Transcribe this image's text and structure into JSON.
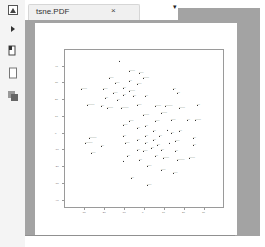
{
  "tab": {
    "title": "tsne.PDF",
    "close_glyph": "×",
    "dropdown_glyph": "▾"
  },
  "sidebar": {
    "items": [
      {
        "name": "app-logo-icon",
        "glyph": "◩"
      },
      {
        "name": "expand-arrow-icon",
        "glyph": "▸"
      },
      {
        "name": "page-view-icon",
        "glyph": "▯"
      },
      {
        "name": "single-page-icon",
        "glyph": "□"
      },
      {
        "name": "thumbnails-icon",
        "glyph": "❐"
      }
    ]
  },
  "colors": {
    "viewer_bg": "#a3a3a3",
    "page_bg": "#ffffff",
    "sidebar_bg": "#f4f4f4",
    "point": "#333333"
  },
  "chart_data": {
    "type": "scatter",
    "title": "",
    "xlabel": "",
    "ylabel": "",
    "xlim": [
      -40,
      40
    ],
    "ylim": [
      -45,
      50
    ],
    "x_ticks": [
      -30,
      -20,
      -10,
      0,
      10,
      20,
      30
    ],
    "y_ticks": [
      -40,
      -30,
      -20,
      -10,
      0,
      10,
      20,
      30,
      40
    ],
    "grid": false,
    "legend": null,
    "note": "t-SNE embedding; each point has a small text label illegible at this resolution",
    "points": [
      {
        "x": -13,
        "y": 44,
        "label": "·"
      },
      {
        "x": -8,
        "y": 38,
        "label": "~~~~"
      },
      {
        "x": -3,
        "y": 37,
        "label": "~~~"
      },
      {
        "x": -18,
        "y": 34,
        "label": "~~~"
      },
      {
        "x": -1,
        "y": 34,
        "label": "~~~~"
      },
      {
        "x": -8,
        "y": 32,
        "label": "~~"
      },
      {
        "x": -15,
        "y": 31,
        "label": "~~~"
      },
      {
        "x": -4,
        "y": 30,
        "label": "~~~"
      },
      {
        "x": -32,
        "y": 27,
        "label": "~~~~"
      },
      {
        "x": -21,
        "y": 27,
        "label": "~~~"
      },
      {
        "x": -11,
        "y": 28,
        "label": "~~"
      },
      {
        "x": -8,
        "y": 26,
        "label": "~~~~"
      },
      {
        "x": -16,
        "y": 25,
        "label": "~~~"
      },
      {
        "x": -11,
        "y": 24,
        "label": "~~"
      },
      {
        "x": -6,
        "y": 23,
        "label": "~~"
      },
      {
        "x": -20,
        "y": 22,
        "label": "~~"
      },
      {
        "x": -14,
        "y": 21,
        "label": "~~"
      },
      {
        "x": 0,
        "y": 23,
        "label": "~~"
      },
      {
        "x": 14,
        "y": 27,
        "label": "~~"
      },
      {
        "x": 16,
        "y": 25,
        "label": "~~"
      },
      {
        "x": -29,
        "y": 18,
        "label": "~~~~~"
      },
      {
        "x": -22,
        "y": 17,
        "label": "~~"
      },
      {
        "x": -19,
        "y": 16,
        "label": "~~~~"
      },
      {
        "x": -12,
        "y": 16,
        "label": "~~~~~"
      },
      {
        "x": -4,
        "y": 18,
        "label": "~~~"
      },
      {
        "x": 5,
        "y": 17,
        "label": "~~~~"
      },
      {
        "x": 10,
        "y": 17,
        "label": "~~~~~"
      },
      {
        "x": 17,
        "y": 16,
        "label": "~~~~"
      },
      {
        "x": 26,
        "y": 18,
        "label": "~~"
      },
      {
        "x": 8,
        "y": 13,
        "label": "~~~~"
      },
      {
        "x": -1,
        "y": 12,
        "label": "~~~~"
      },
      {
        "x": -8,
        "y": 8,
        "label": "~~~"
      },
      {
        "x": -11,
        "y": 6,
        "label": "~~~"
      },
      {
        "x": 5,
        "y": 8,
        "label": "~~~"
      },
      {
        "x": 13,
        "y": 9,
        "label": "~~~"
      },
      {
        "x": 21,
        "y": 9,
        "label": "~~"
      },
      {
        "x": 25,
        "y": 9,
        "label": "~~~~"
      },
      {
        "x": -4,
        "y": 4,
        "label": "~~"
      },
      {
        "x": 0,
        "y": 5,
        "label": "~~"
      },
      {
        "x": 11,
        "y": 3,
        "label": "·"
      },
      {
        "x": 4,
        "y": 2,
        "label": "~~"
      },
      {
        "x": 13,
        "y": 1,
        "label": "~~"
      },
      {
        "x": 17,
        "y": 2,
        "label": "~~"
      },
      {
        "x": -11,
        "y": -1,
        "label": "~~"
      },
      {
        "x": 0,
        "y": -1,
        "label": "~~"
      },
      {
        "x": 7,
        "y": -1,
        "label": "~~"
      },
      {
        "x": -28,
        "y": -2,
        "label": "~~~~~"
      },
      {
        "x": -4,
        "y": -3,
        "label": "~~"
      },
      {
        "x": 4,
        "y": -3,
        "label": "~~"
      },
      {
        "x": 15,
        "y": -4,
        "label": "~~~"
      },
      {
        "x": 24,
        "y": -2,
        "label": "~~"
      },
      {
        "x": -30,
        "y": -5,
        "label": "~~~~~"
      },
      {
        "x": -10,
        "y": -5,
        "label": "~~~"
      },
      {
        "x": 0,
        "y": -5,
        "label": "~~"
      },
      {
        "x": 6,
        "y": -6,
        "label": "~~"
      },
      {
        "x": 12,
        "y": -5,
        "label": "·"
      },
      {
        "x": 24,
        "y": -6,
        "label": "~~"
      },
      {
        "x": -22,
        "y": -7,
        "label": "~~"
      },
      {
        "x": -4,
        "y": -9,
        "label": "~~"
      },
      {
        "x": 3,
        "y": -8,
        "label": "~~"
      },
      {
        "x": 8,
        "y": -9,
        "label": "~~"
      },
      {
        "x": -1,
        "y": -10,
        "label": "~~~"
      },
      {
        "x": 15,
        "y": -10,
        "label": "~~"
      },
      {
        "x": -27,
        "y": -11,
        "label": "~~~"
      },
      {
        "x": -9,
        "y": -13,
        "label": "~~"
      },
      {
        "x": 5,
        "y": -13,
        "label": "~~"
      },
      {
        "x": 9,
        "y": -14,
        "label": "~~~~"
      },
      {
        "x": -3,
        "y": -15,
        "label": "~~"
      },
      {
        "x": 16,
        "y": -15,
        "label": "~~~~~"
      },
      {
        "x": 22,
        "y": -14,
        "label": "~~~~"
      },
      {
        "x": -11,
        "y": -16,
        "label": "·"
      },
      {
        "x": 1,
        "y": -19,
        "label": "~~~"
      },
      {
        "x": 8,
        "y": -21,
        "label": "~~~"
      },
      {
        "x": 14,
        "y": -23,
        "label": "~~~"
      },
      {
        "x": -7,
        "y": -26,
        "label": "~~"
      },
      {
        "x": 1,
        "y": -30,
        "label": "~~~"
      }
    ]
  }
}
